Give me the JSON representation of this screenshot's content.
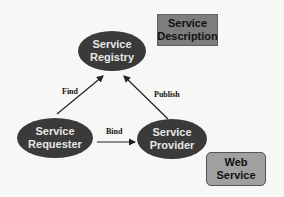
{
  "diagram": {
    "nodes": {
      "registry": {
        "line1": "Service",
        "line2": "Registry"
      },
      "requester": {
        "line1": "Service",
        "line2": "Requester"
      },
      "provider": {
        "line1": "Service",
        "line2": "Provider"
      }
    },
    "boxes": {
      "description": {
        "line1": "Service",
        "line2": "Description"
      },
      "web_service": {
        "line1": "Web",
        "line2": "Service"
      }
    },
    "edges": {
      "find": "Find",
      "publish": "Publish",
      "bind": "Bind"
    },
    "colors": {
      "node_fill": "#3a3a3a",
      "node_text": "#e6e6e6",
      "description_fill": "#7d7d7d",
      "web_service_fill": "#a0a0a0",
      "background": "#f7f7f5"
    }
  }
}
